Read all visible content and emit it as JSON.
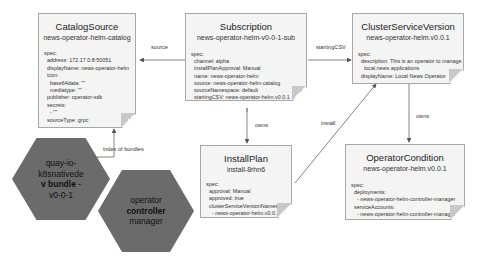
{
  "nodes": {
    "catalog_source": {
      "title": "CatalogSource",
      "name": "news-operator-helm-catalog",
      "spec": "spec:\n  address: 172.17.0.8:50051\n  displayName: news-operator-helm\n  icon:\n    base64data: \"\"\n    mediatype: \"\"\n  publisher: operator-sdk\n  secrets:\n    - \"\"\n  sourceType: grpc"
    },
    "subscription": {
      "title": "Subscription",
      "name": "news-operator-helm-v0-0-1-sub",
      "spec": "spec:\n  channel: alpha\n  installPlanApproval: Manual\n  name: news-operator-helm\n  source: news-operator-helm-catalog\n  sourceNamespace: default\n  startingCSV: news-operator-helm.v0.0.1"
    },
    "cluster_service_version": {
      "title": "ClusterServiceVersion",
      "name": "news-operator-helm.v0.0.1",
      "spec": "spec:\n  description: This is an operator to manage\n    local news applications\n  displayName: Local News Operator"
    },
    "install_plan": {
      "title": "InstallPlan",
      "name": "install-8rhn6",
      "spec": "spec:\n  approval: Manual\n  approved: true\n  clusterServiceVersionNames:\n    - news-operator-helm.v0.0.1"
    },
    "operator_condition": {
      "title": "OperatorCondition",
      "name": "news-operator-helm.v0.0.1",
      "spec": "spec:\n  deployments:\n    - news-operator-helm-controller-manager\n  serviceAccounts:\n    - news-operator-helm-controller-manager"
    },
    "bundle": {
      "line1": "quay-io-",
      "line2": "k8snativede",
      "line3_bold": "v bundle",
      "line3_rest": " -",
      "line4": "v0-0-1"
    },
    "controller": {
      "line1": "operator",
      "line2_bold": "controller",
      "line3": "manager"
    }
  },
  "edges": {
    "source": "source",
    "starting_csv": "startingCSV",
    "owns_ip": "owns",
    "install": "install",
    "owns_oc": "owns",
    "index_of_bundles": "index of bundles"
  }
}
